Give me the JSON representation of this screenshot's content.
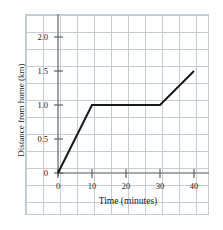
{
  "chart_data": {
    "type": "line",
    "title": "",
    "xlabel": "Time (minutes)",
    "ylabel": "Distance from home (km)",
    "xlim": [
      0,
      40
    ],
    "ylim": [
      0,
      2.0
    ],
    "xticks": [
      "0",
      "10",
      "20",
      "30",
      "40"
    ],
    "xtick_values": [
      0,
      10,
      20,
      30,
      40
    ],
    "yticks": [
      "0",
      "0.5",
      "1.0",
      "1.5",
      "2.0"
    ],
    "ytick_values": [
      0,
      0.5,
      1.0,
      1.5,
      2.0
    ],
    "grid": true,
    "grid_style": "graph-paper",
    "legend": null,
    "series": [
      {
        "name": "Distance from home",
        "x": [
          0,
          10,
          30,
          40
        ],
        "values": [
          0,
          1.0,
          1.0,
          1.5
        ],
        "color": "#1a1a1a"
      }
    ]
  },
  "axes": {
    "axis_color": "#8a8a8a",
    "grid_color": "#c3cdd6",
    "text_color": "#1a1a1a"
  }
}
